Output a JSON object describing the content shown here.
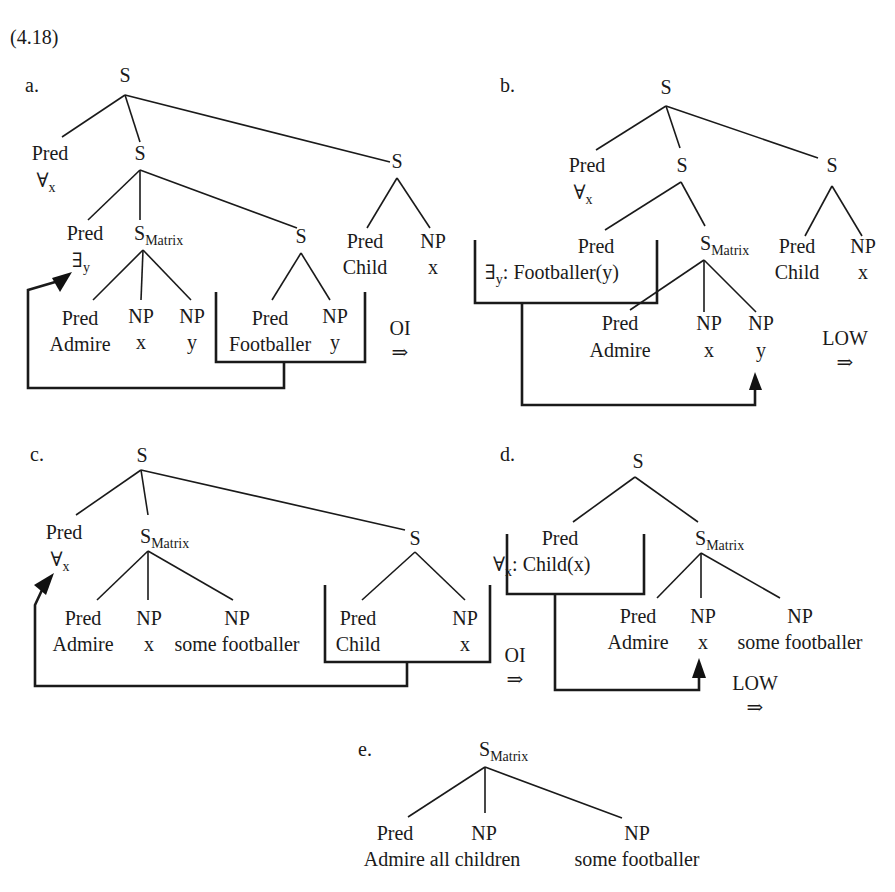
{
  "example_number": "(4.18)",
  "colors": {
    "ink": "#1a1a1a",
    "background": "#ffffff"
  },
  "panels": [
    {
      "id": "a",
      "label": "a.",
      "label_pos": [
        25,
        92
      ],
      "nodes": [
        {
          "id": "S0",
          "text": "S",
          "x": 125,
          "y": 82
        },
        {
          "id": "P1",
          "text": "Pred",
          "x": 50,
          "y": 160,
          "sub2": "∀",
          "sub2sub": "x",
          "x2": 50,
          "y2": 187
        },
        {
          "id": "S1",
          "text": "S",
          "x": 140,
          "y": 160
        },
        {
          "id": "S2",
          "text": "S",
          "x": 397,
          "y": 168
        },
        {
          "id": "P2",
          "text": "Pred",
          "x": 85,
          "y": 240,
          "sub2": "∃",
          "sub2sub": "y",
          "x2": 85,
          "y2": 267
        },
        {
          "id": "SM",
          "text": "S",
          "sub": "Matrix",
          "x": 140,
          "y": 240
        },
        {
          "id": "S3",
          "text": "S",
          "x": 301,
          "y": 243
        },
        {
          "id": "P3",
          "text": "Pred",
          "x": 365,
          "y": 248,
          "line2": "Child",
          "x2": 365,
          "y2": 274
        },
        {
          "id": "N3",
          "text": "NP",
          "x": 433,
          "y": 248,
          "line2": "x",
          "x2": 433,
          "y2": 274
        },
        {
          "id": "P4",
          "text": "Pred",
          "x": 80,
          "y": 325,
          "line2": "Admire",
          "x2": 80,
          "y2": 351
        },
        {
          "id": "N4",
          "text": "NP",
          "x": 141,
          "y": 323,
          "line2": "x",
          "x2": 141,
          "y2": 349
        },
        {
          "id": "N5",
          "text": "NP",
          "x": 192,
          "y": 323,
          "line2": "y",
          "x2": 192,
          "y2": 349
        },
        {
          "id": "P5",
          "text": "Pred",
          "x": 270,
          "y": 325,
          "line2": "Footballer",
          "x2": 270,
          "y2": 351
        },
        {
          "id": "N6",
          "text": "NP",
          "x": 335,
          "y": 323,
          "line2": "y",
          "x2": 335,
          "y2": 349
        }
      ],
      "edges": [
        [
          125,
          95,
          62,
          137
        ],
        [
          125,
          95,
          140,
          142
        ],
        [
          125,
          95,
          390,
          162
        ],
        [
          140,
          170,
          88,
          220
        ],
        [
          140,
          170,
          140,
          220
        ],
        [
          140,
          170,
          297,
          228
        ],
        [
          397,
          178,
          367,
          228
        ],
        [
          397,
          178,
          430,
          228
        ],
        [
          143,
          250,
          93,
          300
        ],
        [
          143,
          250,
          141,
          300
        ],
        [
          143,
          250,
          191,
          300
        ],
        [
          301,
          253,
          272,
          300
        ],
        [
          301,
          253,
          330,
          300
        ]
      ],
      "box": {
        "x1": 216,
        "x2": 365,
        "top": 292,
        "bottom": 362
      },
      "arrow_path": "M284,362 L284,388 L28,388 L28,290 L62,280",
      "arrowhead": "M72,272 L52,278 L60,292 Z",
      "transition": {
        "label": "OI",
        "arrow": "⇒",
        "x": 400,
        "y": 335
      }
    },
    {
      "id": "b",
      "label": "b.",
      "label_pos": [
        500,
        92
      ],
      "nodes": [
        {
          "id": "S0",
          "text": "S",
          "x": 666,
          "y": 94
        },
        {
          "id": "P1",
          "text": "Pred",
          "x": 587,
          "y": 172,
          "sub2": "∀",
          "sub2sub": "x",
          "x2": 587,
          "y2": 199
        },
        {
          "id": "S1",
          "text": "S",
          "x": 682,
          "y": 172
        },
        {
          "id": "S2",
          "text": "S",
          "x": 832,
          "y": 172
        },
        {
          "id": "P2",
          "text": "Pred",
          "x": 596,
          "y": 253
        },
        {
          "id": "BX",
          "text": "∃",
          "sub": "y",
          "tail": ": Footballer(y)",
          "x": 567,
          "y": 279
        },
        {
          "id": "SM",
          "text": "S",
          "sub": "Matrix",
          "x": 706,
          "y": 250
        },
        {
          "id": "P3",
          "text": "Pred",
          "x": 797,
          "y": 253,
          "line2": "Child",
          "x2": 797,
          "y2": 279
        },
        {
          "id": "N3",
          "text": "NP",
          "x": 863,
          "y": 253,
          "line2": "x",
          "x2": 863,
          "y2": 279
        },
        {
          "id": "P4",
          "text": "Pred",
          "x": 620,
          "y": 330,
          "line2": "Admire",
          "x2": 620,
          "y2": 357
        },
        {
          "id": "N4",
          "text": "NP",
          "x": 709,
          "y": 330,
          "line2": "x",
          "x2": 709,
          "y2": 357
        },
        {
          "id": "N5",
          "text": "NP",
          "x": 761,
          "y": 330,
          "line2": "y",
          "x2": 761,
          "y2": 357
        }
      ],
      "edges": [
        [
          666,
          106,
          596,
          150
        ],
        [
          666,
          106,
          680,
          148
        ],
        [
          666,
          106,
          818,
          158
        ],
        [
          681,
          182,
          605,
          230
        ],
        [
          681,
          182,
          705,
          226
        ],
        [
          832,
          186,
          805,
          236
        ],
        [
          832,
          186,
          862,
          236
        ],
        [
          704,
          260,
          630,
          310
        ],
        [
          704,
          260,
          704,
          312
        ],
        [
          704,
          260,
          756,
          312
        ]
      ],
      "box": {
        "x1": 475,
        "x2": 657,
        "top": 240,
        "bottom": 303
      },
      "arrow_path": "M522,303 L522,405 L755,405 L755,378",
      "arrowhead": "M749,390 L755,372 L762,390 Z",
      "transition": {
        "label": "LOW",
        "arrow": "⇒",
        "x": 845,
        "y": 345
      }
    },
    {
      "id": "c",
      "label": "c.",
      "label_pos": [
        30,
        461
      ],
      "nodes": [
        {
          "id": "S0",
          "text": "S",
          "x": 142,
          "y": 462
        },
        {
          "id": "P1",
          "text": "Pred",
          "x": 64,
          "y": 539,
          "sub2": "∀",
          "sub2sub": "x",
          "x2": 64,
          "y2": 566
        },
        {
          "id": "SM",
          "text": "S",
          "sub": "Matrix",
          "x": 146,
          "y": 543
        },
        {
          "id": "S2",
          "text": "S",
          "x": 415,
          "y": 545
        },
        {
          "id": "P2",
          "text": "Pred",
          "x": 83,
          "y": 625,
          "line2": "Admire",
          "x2": 83,
          "y2": 651
        },
        {
          "id": "N2",
          "text": "NP",
          "x": 149,
          "y": 625,
          "line2": "x",
          "x2": 149,
          "y2": 651
        },
        {
          "id": "N3",
          "text": "NP",
          "x": 237,
          "y": 625,
          "line2": "some footballer",
          "x2": 237,
          "y2": 651
        },
        {
          "id": "P3",
          "text": "Pred",
          "x": 358,
          "y": 625,
          "line2": "Child",
          "x2": 358,
          "y2": 651
        },
        {
          "id": "N4",
          "text": "NP",
          "x": 465,
          "y": 625,
          "line2": "x",
          "x2": 465,
          "y2": 651
        }
      ],
      "edges": [
        [
          141,
          470,
          76,
          515
        ],
        [
          141,
          470,
          148,
          515
        ],
        [
          141,
          470,
          405,
          530
        ],
        [
          148,
          551,
          97,
          600
        ],
        [
          148,
          551,
          148,
          600
        ],
        [
          148,
          551,
          233,
          600
        ],
        [
          415,
          552,
          362,
          600
        ],
        [
          415,
          552,
          465,
          600
        ]
      ],
      "box": {
        "x1": 325,
        "x2": 490,
        "top": 585,
        "bottom": 662
      },
      "arrow_path": "M407,662 L407,686 L35,686 L35,605 L42,590",
      "arrowhead": "M54,573 L34,585 L46,595 Z",
      "transition": {
        "label": "OI",
        "arrow": "⇒",
        "x": 515,
        "y": 662
      }
    },
    {
      "id": "d",
      "label": "d.",
      "label_pos": [
        500,
        461
      ],
      "nodes": [
        {
          "id": "S0",
          "text": "S",
          "x": 638,
          "y": 468
        },
        {
          "id": "P1",
          "text": "Pred",
          "x": 560,
          "y": 545
        },
        {
          "id": "BX",
          "text": "∀",
          "sub": "x",
          "tail": ": Child(x)",
          "x": 575,
          "y": 571
        },
        {
          "id": "SM",
          "text": "S",
          "sub": "Matrix",
          "x": 701,
          "y": 545
        },
        {
          "id": "P2",
          "text": "Pred",
          "x": 638,
          "y": 623,
          "line2": "Admire",
          "x2": 638,
          "y2": 649
        },
        {
          "id": "N2",
          "text": "NP",
          "x": 703,
          "y": 623,
          "line2": "x",
          "x2": 703,
          "y2": 649
        },
        {
          "id": "N3",
          "text": "NP",
          "x": 800,
          "y": 623,
          "line2": "some footballer",
          "x2": 800,
          "y2": 649
        }
      ],
      "edges": [
        [
          635,
          477,
          573,
          522
        ],
        [
          635,
          477,
          698,
          522
        ],
        [
          701,
          553,
          657,
          598
        ],
        [
          701,
          553,
          701,
          598
        ],
        [
          701,
          553,
          780,
          598
        ]
      ],
      "box": {
        "x1": 507,
        "x2": 644,
        "top": 534,
        "bottom": 594
      },
      "arrow_path": "M555,594 L555,690 L699,690 L699,670",
      "arrowhead": "M692,678 L699,658 L706,678 Z",
      "transition": {
        "label": "LOW",
        "arrow": "⇒",
        "x": 755,
        "y": 690
      }
    },
    {
      "id": "e",
      "label": "e.",
      "label_pos": [
        358,
        756
      ],
      "nodes": [
        {
          "id": "SM",
          "text": "S",
          "sub": "Matrix",
          "x": 485,
          "y": 756
        },
        {
          "id": "P1",
          "text": "Pred",
          "x": 395,
          "y": 840,
          "line2": "Admire all children",
          "x2": 442,
          "y2": 866
        },
        {
          "id": "N1",
          "text": "NP",
          "x": 484,
          "y": 840
        },
        {
          "id": "N2",
          "text": "NP",
          "x": 637,
          "y": 840,
          "line2": "some footballer",
          "x2": 637,
          "y2": 866
        }
      ],
      "edges": [
        [
          485,
          767,
          408,
          817
        ],
        [
          485,
          767,
          485,
          813
        ],
        [
          485,
          767,
          622,
          818
        ]
      ],
      "box": null,
      "arrow_path": null,
      "arrowhead": null,
      "transition": null
    }
  ]
}
